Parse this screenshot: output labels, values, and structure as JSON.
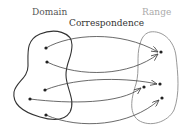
{
  "labels": {
    "domain": "Domain",
    "correspondence": "Correspondence",
    "range": "Range"
  },
  "colors": {
    "domain_outline": "#333333",
    "range_outline": "#999999",
    "arrow": "#444444",
    "point": "#222222"
  },
  "domain_points": [
    [
      46,
      48
    ],
    [
      47,
      62
    ],
    [
      45,
      90
    ],
    [
      30,
      99
    ],
    [
      46,
      115
    ]
  ],
  "range_points": [
    [
      161,
      52
    ],
    [
      160,
      84
    ],
    [
      162,
      98
    ],
    [
      144,
      87
    ]
  ],
  "mappings": [
    {
      "from": 0,
      "to": 0
    },
    {
      "from": 1,
      "to": 0
    },
    {
      "from": 2,
      "to": 1
    },
    {
      "from": 3,
      "to": 3
    },
    {
      "from": 4,
      "to": 2
    }
  ]
}
